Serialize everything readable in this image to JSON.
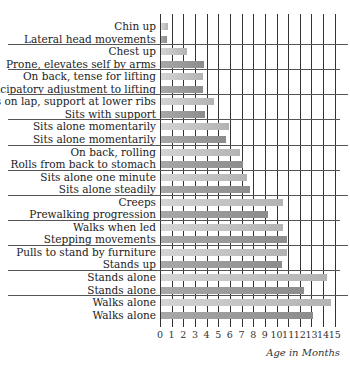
{
  "chart_data": {
    "type": "bar",
    "orientation": "horizontal",
    "title": "",
    "xlabel": "Age in Months",
    "ylabel": "",
    "xlim": [
      0,
      15
    ],
    "xticks": [
      "0",
      "1",
      "2",
      "3",
      "4",
      "5",
      "6",
      "7",
      "8",
      "9",
      "10",
      "11",
      "12",
      "13",
      "14",
      "15"
    ],
    "grid": true,
    "groups": [
      {
        "items": [
          {
            "label": "Chin up",
            "value": 0.7
          },
          {
            "label": "Lateral head movements",
            "value": 0.6
          }
        ]
      },
      {
        "items": [
          {
            "label": "Chest up",
            "value": 2.3
          },
          {
            "label": "Prone, elevates self by arms",
            "value": 3.8
          }
        ]
      },
      {
        "items": [
          {
            "label": "On back, tense for lifting",
            "value": 3.7
          },
          {
            "label": "Anticipatory adjustment to lifting",
            "value": 3.7
          }
        ]
      },
      {
        "items": [
          {
            "label": "Sits on lap, support at lower ribs",
            "value": 4.6
          },
          {
            "label": "Sits with support",
            "value": 3.9
          }
        ]
      },
      {
        "items": [
          {
            "label": "Sits alone momentarily",
            "value": 5.9
          },
          {
            "label": "Sits alone momentarily",
            "value": 5.7
          }
        ]
      },
      {
        "items": [
          {
            "label": "On back, rolling",
            "value": 6.9
          },
          {
            "label": "Rolls from back to stomach",
            "value": 7.1
          }
        ]
      },
      {
        "items": [
          {
            "label": "Sits alone one minute",
            "value": 7.5
          },
          {
            "label": "Sits alone steadily",
            "value": 7.7
          }
        ]
      },
      {
        "items": [
          {
            "label": "Creeps",
            "value": 10.6
          },
          {
            "label": "Prewalking progression",
            "value": 9.3
          }
        ]
      },
      {
        "items": [
          {
            "label": "Walks when led",
            "value": 10.6
          },
          {
            "label": "Stepping movements",
            "value": 10.9
          }
        ]
      },
      {
        "items": [
          {
            "label": "Pulls to stand by furniture",
            "value": 10.9
          },
          {
            "label": "Stands up",
            "value": 10.5
          }
        ]
      },
      {
        "items": [
          {
            "label": "Stands alone",
            "value": 14.3
          },
          {
            "label": "Stands alone",
            "value": 12.4
          }
        ]
      },
      {
        "items": [
          {
            "label": "Walks alone",
            "value": 14.7
          },
          {
            "label": "Walks alone",
            "value": 13.1
          }
        ]
      }
    ],
    "series_colors": {
      "first_in_pair": "#c4c4c4",
      "second_in_pair": "#999999"
    }
  }
}
